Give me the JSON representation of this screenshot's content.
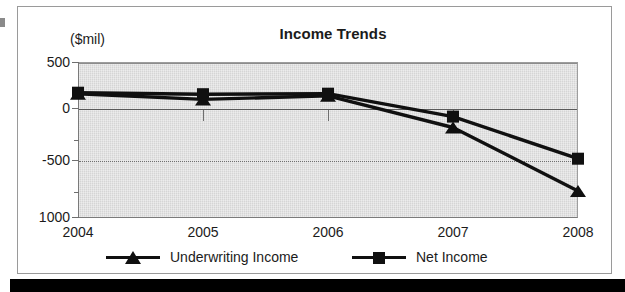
{
  "figure": {
    "title": "Income Trends",
    "axis_units_label": "($mil)"
  },
  "chart_data": {
    "type": "line",
    "title": "Income Trends",
    "xlabel": "",
    "ylabel": "($mil)",
    "ylim": [
      -1000,
      500
    ],
    "ytick_labels": [
      "500",
      "0",
      "-500",
      "1000"
    ],
    "ytick_values": [
      500,
      0,
      -500,
      -1000
    ],
    "yminor_ticks": [
      250,
      -250,
      -750
    ],
    "grid": true,
    "legend_position": "bottom",
    "categories": [
      "2004",
      "2005",
      "2006",
      "2007",
      "2008"
    ],
    "series": [
      {
        "name": "Underwriting Income",
        "marker": "triangle",
        "values": [
          195,
          140,
          175,
          -130,
          -740
        ]
      },
      {
        "name": "Net Income",
        "marker": "square",
        "values": [
          205,
          190,
          195,
          -25,
          -430
        ]
      }
    ]
  },
  "legend": {
    "entries": [
      {
        "label": "Underwriting Income",
        "marker": "triangle-marker"
      },
      {
        "label": "Net Income",
        "marker": "square-marker"
      }
    ]
  }
}
